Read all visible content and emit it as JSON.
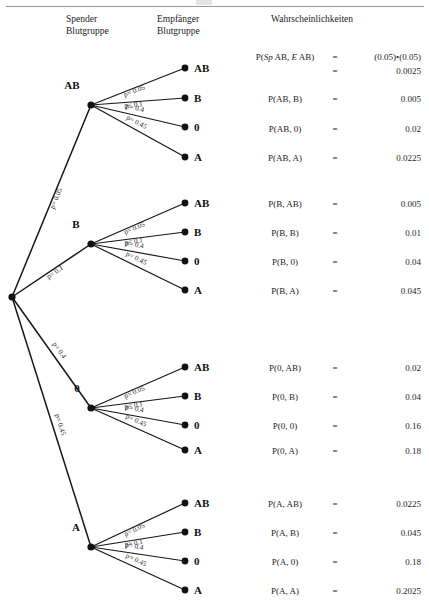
{
  "headers": {
    "donor": "Spender\nBlutgruppe",
    "recipient": "Empfänger\nBlutgruppe",
    "probabilities": "Wahrscheinlichkeiten"
  },
  "tree": {
    "root_label": "",
    "branch_prefix": "p=",
    "level1": [
      {
        "label": "AB",
        "p": "0.05",
        "edge_text": "p= 0.05"
      },
      {
        "label": "B",
        "p": "0.1",
        "edge_text": "p= 0.1"
      },
      {
        "label": "0",
        "p": "0.4",
        "edge_text": "p= 0.4"
      },
      {
        "label": "A",
        "p": "0.45",
        "edge_text": "p= 0.45"
      }
    ],
    "level2": [
      {
        "label": "AB",
        "p": "0.05",
        "edge_text": "p= 0.05"
      },
      {
        "label": "B",
        "p": "0.1",
        "edge_text": "p= 0.1"
      },
      {
        "label": "0",
        "p": "0.4",
        "edge_text": "p= 0.4"
      },
      {
        "label": "A",
        "p": "0.45",
        "edge_text": "p= 0.45"
      }
    ]
  },
  "groups": [
    {
      "donor": "AB",
      "rows": [
        {
          "expr_html": "P(<i>Sp</i> AB, <i>E</i> AB)",
          "eq": "=",
          "value": "(0.05)•(0.05)"
        },
        {
          "expr_html": "",
          "eq": "=",
          "value": "0.0025"
        },
        {
          "expr_html": "P(AB, B)",
          "eq": "=",
          "value": "0.005"
        },
        {
          "expr_html": "P(AB, 0)",
          "eq": "=",
          "value": "0.02"
        },
        {
          "expr_html": "P(AB, A)",
          "eq": "=",
          "value": "0.0225"
        }
      ]
    },
    {
      "donor": "B",
      "rows": [
        {
          "expr_html": "P(B, AB)",
          "eq": "=",
          "value": "0.005"
        },
        {
          "expr_html": "P(B, B)",
          "eq": "=",
          "value": "0.01"
        },
        {
          "expr_html": "P(B, 0)",
          "eq": "=",
          "value": "0.04"
        },
        {
          "expr_html": "P(B, A)",
          "eq": "=",
          "value": "0.045"
        }
      ]
    },
    {
      "donor": "0",
      "rows": [
        {
          "expr_html": "P(0, AB)",
          "eq": "=",
          "value": "0.02"
        },
        {
          "expr_html": "P(0, B)",
          "eq": "=",
          "value": "0.04"
        },
        {
          "expr_html": "P(0, 0)",
          "eq": "=",
          "value": "0.16"
        },
        {
          "expr_html": "P(0, A)",
          "eq": "=",
          "value": "0.18"
        }
      ]
    },
    {
      "donor": "A",
      "rows": [
        {
          "expr_html": "P(A, AB)",
          "eq": "=",
          "value": "0.0225"
        },
        {
          "expr_html": "P(A, B)",
          "eq": "=",
          "value": "0.045"
        },
        {
          "expr_html": "P(A, 0)",
          "eq": "=",
          "value": "0.18"
        },
        {
          "expr_html": "P(A, A)",
          "eq": "=",
          "value": "0.2025"
        }
      ]
    }
  ],
  "prob_rows_flat": [
    {
      "expr_html": "P(<i>Sp</i> AB, <i>E</i> AB)",
      "eq": "=",
      "value": "(0.05)•(0.05)",
      "top": 52
    },
    {
      "expr_html": "",
      "eq": "=",
      "value": "0.0025",
      "top": 66
    },
    {
      "expr_html": "P(AB, B)",
      "eq": "=",
      "value": "0.005",
      "top": 94
    },
    {
      "expr_html": "P(AB, 0)",
      "eq": "=",
      "value": "0.02",
      "top": 124
    },
    {
      "expr_html": "P(AB, A)",
      "eq": "=",
      "value": "0.0225",
      "top": 153
    },
    {
      "expr_html": "P(B, AB)",
      "eq": "=",
      "value": "0.005",
      "top": 199
    },
    {
      "expr_html": "P(B, B)",
      "eq": "=",
      "value": "0.01",
      "top": 228
    },
    {
      "expr_html": "P(B, 0)",
      "eq": "=",
      "value": "0.04",
      "top": 257
    },
    {
      "expr_html": "P(B, A)",
      "eq": "=",
      "value": "0.045",
      "top": 286
    },
    {
      "expr_html": "P(0, AB)",
      "eq": "=",
      "value": "0.02",
      "top": 363
    },
    {
      "expr_html": "P(0, B)",
      "eq": "=",
      "value": "0.04",
      "top": 392
    },
    {
      "expr_html": "P(0, 0)",
      "eq": "=",
      "value": "0.16",
      "top": 421
    },
    {
      "expr_html": "P(0, A)",
      "eq": "=",
      "value": "0.18",
      "top": 446
    },
    {
      "expr_html": "P(A, AB)",
      "eq": "=",
      "value": "0.0225",
      "top": 499
    },
    {
      "expr_html": "P(A, B)",
      "eq": "=",
      "value": "0.045",
      "top": 528
    },
    {
      "expr_html": "P(A, 0)",
      "eq": "=",
      "value": "0.18",
      "top": 557
    },
    {
      "expr_html": "P(A, A)",
      "eq": "=",
      "value": "0.2025",
      "top": 586
    }
  ],
  "geometry": {
    "root": {
      "x": 12,
      "y": 297
    },
    "hubs": [
      {
        "label": "AB",
        "x": 91,
        "y": 105,
        "label_x": 72,
        "label_y": 89
      },
      {
        "label": "B",
        "x": 91,
        "y": 244,
        "label_x": 76,
        "label_y": 228
      },
      {
        "label": "0",
        "x": 91,
        "y": 408,
        "label_x": 77,
        "label_y": 392
      },
      {
        "label": "A",
        "x": 91,
        "y": 547,
        "label_x": 76,
        "label_y": 531
      }
    ],
    "leaf_x": 185,
    "leaf_label_x": 194,
    "leaf_sets": [
      [
        68,
        98,
        127,
        157
      ],
      [
        203,
        232,
        261,
        290
      ],
      [
        367,
        396,
        425,
        450
      ],
      [
        503,
        532,
        561,
        590
      ]
    ]
  },
  "colors": {
    "ink": "#111111",
    "rule": "#9a9a9a",
    "text": "#1d1d1d"
  }
}
